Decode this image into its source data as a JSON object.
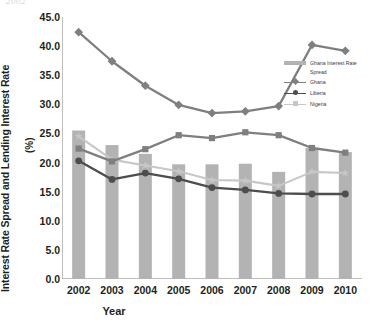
{
  "artifact": {
    "text": "2002"
  },
  "axes": {
    "y_title": "Interest Rate Spread and Lending Interest Rate",
    "y_unit": "(%)",
    "x_title": "Year",
    "y_ticks": [
      "0.0",
      "5.0",
      "10.0",
      "15.0",
      "20.0",
      "25.0",
      "30.0",
      "35.0",
      "40.0",
      "45.0"
    ],
    "x_ticks": [
      "2002",
      "2003",
      "2004",
      "2005",
      "2006",
      "2007",
      "2008",
      "2009",
      "2010"
    ]
  },
  "legend": {
    "position": "right-inside",
    "items": [
      {
        "label": "Ghana Interest Rate",
        "label2": "Spread",
        "type": "bar",
        "color": "#b3b3b3"
      },
      {
        "label": "Ghana",
        "label2": "",
        "type": "line-diamond",
        "color": "#7f7f7f"
      },
      {
        "label": "Liberia",
        "label2": "",
        "type": "line-circle",
        "color": "#4d4d4d"
      },
      {
        "label": "Nigeria",
        "label2": "",
        "type": "line-star",
        "color": "#c7c7c7"
      }
    ]
  },
  "colors": {
    "bar": "#b3b3b3",
    "ghana": "#7f7f7f",
    "liberia": "#4d4d4d",
    "nigeria": "#c7c7c7",
    "axis": "#808080",
    "text": "#231f20"
  },
  "chart_data": {
    "type": "bar",
    "title": "",
    "xlabel": "Year",
    "ylabel": "Interest Rate Spread and Lending Interest Rate (%)",
    "ylim": [
      0,
      45
    ],
    "ytick_step": 5,
    "grid": false,
    "categories": [
      "2002",
      "2003",
      "2004",
      "2005",
      "2006",
      "2007",
      "2008",
      "2009",
      "2010"
    ],
    "series": [
      {
        "name": "Ghana Interest Rate Spread",
        "type": "bar",
        "color": "#b3b3b3",
        "values": [
          25.5,
          23.0,
          21.5,
          19.7,
          19.7,
          19.8,
          18.4,
          22.5,
          21.8
        ]
      },
      {
        "name": "Ghana",
        "type": "line",
        "marker": "diamond",
        "color": "#7f7f7f",
        "values": [
          42.4,
          37.4,
          33.2,
          29.9,
          28.5,
          28.8,
          29.7,
          40.2,
          39.2
        ]
      },
      {
        "name": "Ghana (lending)",
        "type": "line",
        "marker": "square",
        "color": "#7f7f7f",
        "values": [
          22.4,
          20.2,
          22.3,
          24.7,
          24.2,
          25.2,
          24.7,
          22.5,
          21.7
        ]
      },
      {
        "name": "Liberia",
        "type": "line",
        "marker": "circle",
        "color": "#4d4d4d",
        "values": [
          20.3,
          17.1,
          18.2,
          17.2,
          15.7,
          15.3,
          14.7,
          14.6,
          14.6
        ]
      },
      {
        "name": "Nigeria",
        "type": "line",
        "marker": "star",
        "color": "#c7c7c7",
        "values": [
          24.5,
          20.5,
          19.5,
          18.5,
          17.0,
          16.9,
          16.0,
          18.4,
          18.2
        ]
      }
    ]
  }
}
